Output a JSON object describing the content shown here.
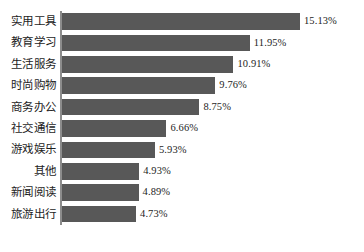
{
  "chart_data": {
    "type": "bar",
    "orientation": "horizontal",
    "title": "",
    "subtitle": "",
    "xlabel": "",
    "ylabel": "",
    "grid": false,
    "legend": false,
    "legend_position": "none",
    "value_suffix": "%",
    "xlim": [
      0,
      15.13
    ],
    "axis_color": "#8c8c8c",
    "bar_color": "#585858",
    "text_color": "#1d1d1d",
    "categories": [
      "实用工具",
      "教育学习",
      "生活服务",
      "时尚购物",
      "商务办公",
      "社交通信",
      "游戏娱乐",
      "其他",
      "新闻阅读",
      "旅游出行"
    ],
    "values": [
      15.13,
      11.95,
      10.91,
      9.76,
      8.75,
      6.66,
      5.93,
      4.93,
      4.89,
      4.73
    ],
    "data_labels": [
      "15.13%",
      "11.95%",
      "10.91%",
      "9.76%",
      "8.75%",
      "6.66%",
      "5.93%",
      "4.93%",
      "4.89%",
      "4.73%"
    ]
  },
  "caption": {
    "text": ""
  }
}
